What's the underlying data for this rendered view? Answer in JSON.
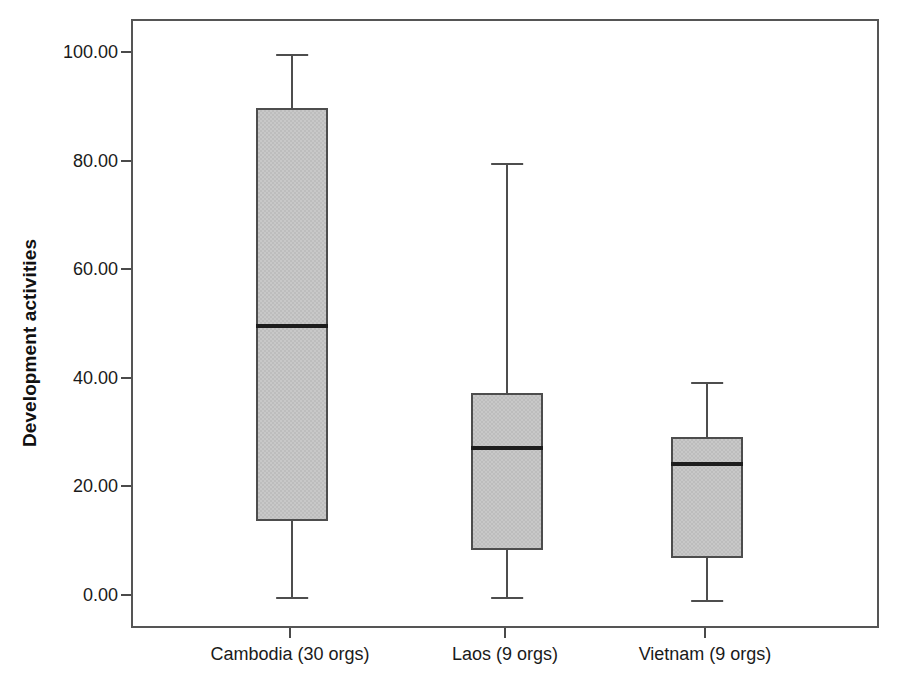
{
  "chart_data": {
    "type": "box",
    "title": "",
    "xlabel": "",
    "ylabel": "Development activities",
    "ylim": [
      -5,
      105
    ],
    "grid": false,
    "legend": "none",
    "yticks": [
      "0.00",
      "20.00",
      "40.00",
      "60.00",
      "80.00",
      "100.00"
    ],
    "ytick_values": [
      0,
      20,
      40,
      60,
      80,
      100
    ],
    "categories": [
      "Cambodia (30 orgs)",
      "Laos (9 orgs)",
      "Vietnam (9 orgs)"
    ],
    "boxes": [
      {
        "category": "Cambodia (30 orgs)",
        "n": 30,
        "min": 0.0,
        "q1": 14.0,
        "median": 50.0,
        "q3": 90.0,
        "max": 100.0,
        "outliers": []
      },
      {
        "category": "Laos (9 orgs)",
        "n": 9,
        "min": 0.0,
        "q1": 8.6,
        "median": 27.5,
        "q3": 37.5,
        "max": 80.0,
        "outliers": []
      },
      {
        "category": "Vietnam (9 orgs)",
        "n": 9,
        "min": -0.5,
        "q1": 7.2,
        "median": 24.5,
        "q3": 29.5,
        "max": 39.6,
        "outliers": []
      }
    ]
  },
  "axes": {
    "y_title": "Development activities",
    "y_tick_labels": [
      "100.00",
      "80.00",
      "60.00",
      "40.00",
      "20.00",
      "0.00"
    ],
    "x_tick_labels": [
      "Cambodia (30 orgs)",
      "Laos (9 orgs)",
      "Vietnam (9 orgs)"
    ]
  },
  "colors": {
    "box_fill": "#c8c8c8",
    "box_edge": "#4d4d4d",
    "median": "#1d1d1d",
    "frame": "#555555",
    "text": "#1a1a1a",
    "background": "#ffffff"
  }
}
